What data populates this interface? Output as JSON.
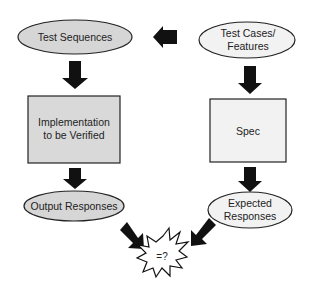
{
  "diagram": {
    "type": "flowchart",
    "nodes": {
      "test_sequences": {
        "label": "Test Sequences",
        "shape": "ellipse",
        "fill": "#d6d6d6"
      },
      "test_cases": {
        "label_line1": "Test Cases/",
        "label_line2": "Features",
        "shape": "ellipse",
        "fill": "#f2f2f2"
      },
      "implementation": {
        "label_line1": "Implementation",
        "label_line2": "to be Verified",
        "shape": "rectangle",
        "fill": "#d9d9d9"
      },
      "spec": {
        "label": "Spec",
        "shape": "rectangle",
        "fill": "#f2f2f2"
      },
      "output_responses": {
        "label": "Output Responses",
        "shape": "ellipse",
        "fill": "#d6d6d6"
      },
      "expected_responses": {
        "label_line1": "Expected",
        "label_line2": "Responses",
        "shape": "ellipse",
        "fill": "#f2f2f2"
      },
      "compare": {
        "label": "=?",
        "shape": "starburst",
        "fill": "#ffffff"
      }
    },
    "edges": [
      {
        "from": "Test Cases/Features",
        "to": "Test Sequences",
        "direction": "left"
      },
      {
        "from": "Test Sequences",
        "to": "Implementation to be Verified",
        "direction": "down"
      },
      {
        "from": "Test Cases/Features",
        "to": "Spec",
        "direction": "down"
      },
      {
        "from": "Implementation to be Verified",
        "to": "Output Responses",
        "direction": "down"
      },
      {
        "from": "Spec",
        "to": "Expected Responses",
        "direction": "down"
      },
      {
        "from": "Output Responses",
        "to": "=?",
        "direction": "down-right"
      },
      {
        "from": "Expected Responses",
        "to": "=?",
        "direction": "down-left"
      }
    ],
    "colors": {
      "arrow": "#111111",
      "stroke": "#222222"
    }
  }
}
